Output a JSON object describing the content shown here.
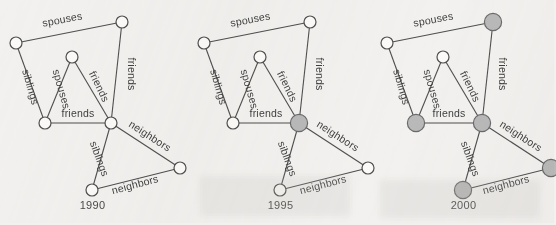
{
  "figure": {
    "background_color": "#f2f1ef",
    "node_open_color": "#fbfaf8",
    "node_filled_color": "#b9b9b9",
    "edge_color": "#4f4f4f"
  },
  "chart_data": {
    "type": "diagram",
    "subtype": "node-link-graph-series",
    "title": "",
    "xlabel": "",
    "ylabel": "",
    "panel_count": 3,
    "shared_nodes": [
      {
        "id": "n1",
        "name": "top-left",
        "x": 16,
        "y": 43,
        "r": 6
      },
      {
        "id": "n2",
        "name": "top-right",
        "x": 122,
        "y": 22,
        "r": 6
      },
      {
        "id": "n3",
        "name": "apex",
        "x": 72,
        "y": 57,
        "r": 6
      },
      {
        "id": "n4",
        "name": "left-mid",
        "x": 45,
        "y": 123,
        "r": 6
      },
      {
        "id": "n5",
        "name": "hub",
        "x": 111,
        "y": 123,
        "r": 6
      },
      {
        "id": "n6",
        "name": "right",
        "x": 180,
        "y": 168,
        "r": 6
      },
      {
        "id": "n7",
        "name": "bottom",
        "x": 92,
        "y": 190,
        "r": 6
      }
    ],
    "shared_edges": [
      {
        "source": "n1",
        "target": "n2",
        "label": "spouses",
        "label_x": 63,
        "label_y": 23,
        "label_rot": -11
      },
      {
        "source": "n1",
        "target": "n4",
        "label": "siblings",
        "label_x": 27,
        "label_y": 88,
        "label_rot": 74
      },
      {
        "source": "n3",
        "target": "n4",
        "label": "spouses",
        "label_x": 58,
        "label_y": 90,
        "label_rot": 74
      },
      {
        "source": "n3",
        "target": "n5",
        "label": "friends",
        "label_x": 96,
        "label_y": 88,
        "label_rot": 64
      },
      {
        "source": "n2",
        "target": "n5",
        "label": "friends",
        "label_x": 128,
        "label_y": 74,
        "label_rot": 90
      },
      {
        "source": "n4",
        "target": "n5",
        "label": "friends",
        "label_x": 78,
        "label_y": 117,
        "label_rot": 0
      },
      {
        "source": "n5",
        "target": "n6",
        "label": "neighbors",
        "label_x": 148,
        "label_y": 139,
        "label_rot": 33
      },
      {
        "source": "n5",
        "target": "n7",
        "label": "siblings",
        "label_x": 96,
        "label_y": 160,
        "label_rot": 70
      },
      {
        "source": "n6",
        "target": "n7",
        "label": "neighbors",
        "label_x": 136,
        "label_y": 188,
        "label_rot": -15
      }
    ],
    "panels": [
      {
        "year": "1990",
        "offset_x": 0,
        "filled_nodes": [],
        "filled_count": 0,
        "node_states": {
          "n1": "open",
          "n2": "open",
          "n3": "open",
          "n4": "open",
          "n5": "open",
          "n6": "open",
          "n7": "open"
        }
      },
      {
        "year": "1995",
        "offset_x": 188,
        "filled_nodes": [
          "n5"
        ],
        "filled_count": 1,
        "node_states": {
          "n1": "open",
          "n2": "open",
          "n3": "open",
          "n4": "open",
          "n5": "filled",
          "n6": "open",
          "n7": "open"
        }
      },
      {
        "year": "2000",
        "offset_x": 371,
        "filled_nodes": [
          "n2",
          "n4",
          "n5",
          "n6",
          "n7"
        ],
        "filled_count": 5,
        "node_states": {
          "n1": "open",
          "n2": "filled",
          "n3": "open",
          "n4": "filled",
          "n5": "filled",
          "n6": "filled",
          "n7": "filled"
        }
      }
    ],
    "edge_label_vocabulary": [
      "spouses",
      "siblings",
      "friends",
      "neighbors"
    ],
    "legend": [],
    "annotations": []
  }
}
